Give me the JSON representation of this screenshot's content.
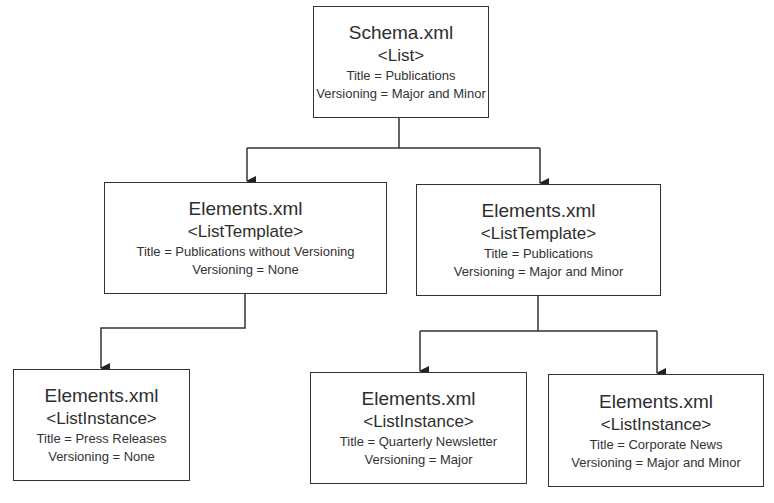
{
  "diagram": {
    "nodes": [
      {
        "id": "schema",
        "file": "Schema.xml",
        "tag": "<List>",
        "title": "Title = Publications",
        "versioning": "Versioning = Major and Minor"
      },
      {
        "id": "template_noversion",
        "file": "Elements.xml",
        "tag": "<ListTemplate>",
        "title": "Title = Publications without Versioning",
        "versioning": "Versioning = None"
      },
      {
        "id": "template_publications",
        "file": "Elements.xml",
        "tag": "<ListTemplate>",
        "title": "Title = Publications",
        "versioning": "Versioning = Major and Minor"
      },
      {
        "id": "instance_press",
        "file": "Elements.xml",
        "tag": "<ListInstance>",
        "title": "Title = Press Releases",
        "versioning": "Versioning = None"
      },
      {
        "id": "instance_newsletter",
        "file": "Elements.xml",
        "tag": "<ListInstance>",
        "title": "Title = Quarterly Newsletter",
        "versioning": "Versioning = Major"
      },
      {
        "id": "instance_corporate",
        "file": "Elements.xml",
        "tag": "<ListInstance>",
        "title": "Title = Corporate News",
        "versioning": "Versioning = Major and Minor"
      }
    ],
    "edges": [
      {
        "from": "schema",
        "to": "template_noversion"
      },
      {
        "from": "schema",
        "to": "template_publications"
      },
      {
        "from": "template_noversion",
        "to": "instance_press"
      },
      {
        "from": "template_publications",
        "to": "instance_newsletter"
      },
      {
        "from": "template_publications",
        "to": "instance_corporate"
      }
    ]
  }
}
